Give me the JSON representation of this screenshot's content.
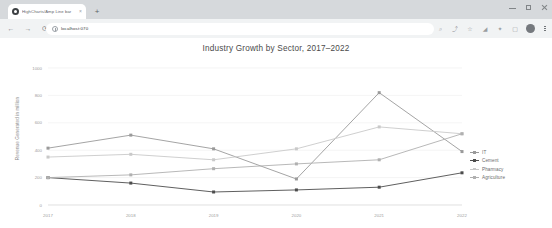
{
  "browser": {
    "tab": {
      "title": "HighCharts/Amp Line bar",
      "close_label": "×",
      "favicon_name": "site-favicon"
    },
    "new_tab_label": "+",
    "window_controls": {
      "minimize": "–",
      "maximize": "□",
      "close": "×"
    },
    "nav": {
      "back": "←",
      "forward": "→",
      "reload": "⟳"
    },
    "omnibox": {
      "url": "localhost:070",
      "placeholder": "Search Google or type a URL"
    },
    "toolbar_icons": [
      {
        "name": "search-icon",
        "glyph": "⌕"
      },
      {
        "name": "share-icon",
        "glyph": "⤴"
      },
      {
        "name": "bookmark-star-icon",
        "glyph": "☆"
      },
      {
        "name": "cast-icon",
        "glyph": "◢"
      },
      {
        "name": "extensions-icon",
        "glyph": "✦"
      },
      {
        "name": "split-screen-icon",
        "glyph": "▢"
      }
    ],
    "profile_name": "profile-avatar",
    "menu_name": "chrome-menu-icon"
  },
  "chart_data": {
    "type": "line",
    "title": "Industry Growth by Sector, 2017–2022",
    "xlabel": "",
    "ylabel": "Revenue Generated in million",
    "categories": [
      "2017",
      "2018",
      "2019",
      "2020",
      "2021",
      "2022"
    ],
    "yticks": [
      0,
      200,
      400,
      600,
      800,
      1000
    ],
    "ylim": [
      0,
      1000
    ],
    "grid": true,
    "legend_position": "right",
    "series": [
      {
        "name": "IT",
        "color": "#9a9a9a",
        "values": [
          415,
          510,
          410,
          190,
          820,
          390
        ]
      },
      {
        "name": "Cement",
        "color": "#4d4d4d",
        "values": [
          200,
          160,
          95,
          110,
          130,
          235
        ]
      },
      {
        "name": "Pharmacy",
        "color": "#c9c9c9",
        "values": [
          350,
          370,
          330,
          410,
          570,
          520
        ]
      },
      {
        "name": "Agriculture",
        "color": "#b0b0b0",
        "values": [
          200,
          220,
          265,
          300,
          330,
          520
        ]
      }
    ]
  }
}
